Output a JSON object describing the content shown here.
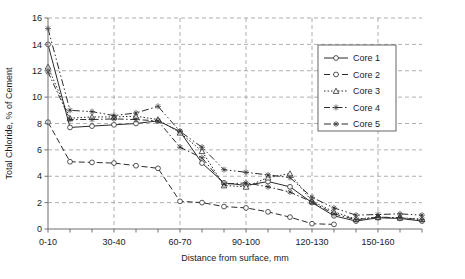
{
  "chart_data": {
    "type": "line",
    "title": "",
    "xlabel": "Distance from surface, mm",
    "ylabel": "Total Chloride, % of Cement",
    "x": [
      0,
      1,
      2,
      3,
      4,
      5,
      6,
      7,
      8,
      9,
      10,
      11,
      12,
      13,
      14,
      15,
      16,
      17
    ],
    "categories": [
      "0-10",
      "10-20",
      "20-30",
      "30-40",
      "40-50",
      "50-60",
      "60-70",
      "70-80",
      "80-90",
      "90-100",
      "100-110",
      "110-120",
      "120-130",
      "130-140",
      "140-150",
      "150-160",
      "160-170",
      "170-180"
    ],
    "tick_labels_shown": [
      "0-10",
      "30-40",
      "60-70",
      "90-100",
      "120-130",
      "150-160"
    ],
    "tick_label_indices": [
      0,
      3,
      6,
      9,
      12,
      15
    ],
    "ylim": [
      0,
      16
    ],
    "yticks": [
      0,
      2,
      4,
      6,
      8,
      10,
      12,
      14,
      16
    ],
    "grid": true,
    "grid_style": "dashed",
    "legend_position": "top-right",
    "series": [
      {
        "name": "Core 1",
        "style": "solid",
        "marker": "circle",
        "values": [
          14.0,
          7.7,
          7.8,
          7.9,
          8.0,
          8.2,
          7.4,
          5.0,
          3.5,
          3.3,
          3.6,
          3.2,
          2.0,
          1.0,
          0.6,
          0.85,
          0.8,
          0.6
        ]
      },
      {
        "name": "Core 2",
        "style": "dashed",
        "marker": "circle",
        "values": [
          8.1,
          5.1,
          5.05,
          5.0,
          4.8,
          4.6,
          2.1,
          2.0,
          1.7,
          1.6,
          1.3,
          0.9,
          0.4,
          0.35,
          null,
          null,
          null,
          null
        ]
      },
      {
        "name": "Core 3",
        "style": "dotted",
        "marker": "triangle",
        "values": [
          12.3,
          8.4,
          8.5,
          8.5,
          8.55,
          8.3,
          7.3,
          5.9,
          3.3,
          3.2,
          3.9,
          4.2,
          2.1,
          1.3,
          0.75,
          0.9,
          0.85,
          0.75
        ]
      },
      {
        "name": "Core 4",
        "style": "dashdot",
        "marker": "star",
        "values": [
          11.9,
          8.3,
          8.3,
          8.35,
          8.3,
          8.2,
          6.2,
          5.4,
          3.4,
          3.5,
          3.2,
          2.8,
          2.05,
          1.15,
          0.7,
          0.9,
          0.85,
          0.7
        ]
      },
      {
        "name": "Core 5",
        "style": "dashdotdot",
        "marker": "star",
        "values": [
          15.2,
          9.0,
          8.9,
          8.6,
          8.8,
          9.3,
          7.4,
          6.2,
          4.5,
          4.3,
          4.1,
          3.9,
          2.4,
          1.6,
          1.05,
          1.1,
          1.15,
          1.05
        ]
      }
    ]
  },
  "legend": {
    "items": [
      {
        "label": "Core 1"
      },
      {
        "label": "Core 2"
      },
      {
        "label": "Core 3"
      },
      {
        "label": "Core 4"
      },
      {
        "label": "Core 5"
      }
    ]
  },
  "axes": {
    "y_title": "Total Chloride, % of Cement",
    "x_title": "Distance from surface, mm",
    "y_tick_labels": [
      "0",
      "2",
      "4",
      "6",
      "8",
      "10",
      "12",
      "14",
      "16"
    ],
    "x_tick_labels": [
      "0-10",
      "30-40",
      "60-70",
      "90-100",
      "120-130",
      "150-160"
    ]
  },
  "colors": {
    "line": "#2b2b2b",
    "grid": "#9a9a9a",
    "axis": "#6e6e6e",
    "text": "#1a1a1a",
    "background": "#ffffff",
    "legend_border": "#555555"
  }
}
